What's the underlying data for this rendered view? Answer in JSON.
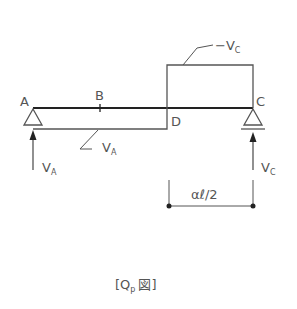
{
  "diagram": {
    "points": {
      "A": "A",
      "B": "B",
      "C": "C",
      "D": "D"
    },
    "reactions": {
      "left": {
        "symbol": "V",
        "subscript": "A"
      },
      "right": {
        "symbol": "V",
        "subscript": "C"
      }
    },
    "shear_labels": {
      "negative_region": {
        "prefix": "−V",
        "subscript": "C"
      },
      "positive_region": {
        "symbol": "V",
        "subscript": "A"
      }
    },
    "dimension": {
      "label": "αℓ/2"
    },
    "caption": {
      "open": "[Q",
      "subscript": "p",
      "kanji": "図",
      "close": "]"
    },
    "colors": {
      "line": "#555555",
      "beam": "#222222",
      "text": "#555555"
    }
  }
}
